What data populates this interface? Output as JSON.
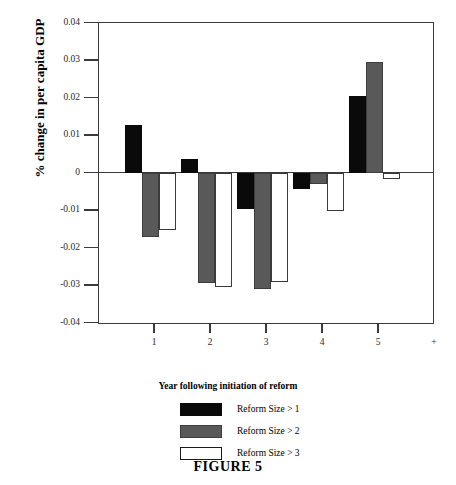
{
  "figure": {
    "caption": "FIGURE 5"
  },
  "chart_data": {
    "type": "bar",
    "title": "",
    "xlabel": "Year following initiation of reform",
    "ylabel": "% change in per capita GDP",
    "categories": [
      "1",
      "2",
      "3",
      "4",
      "5"
    ],
    "xtick_labels": [
      "1",
      "2",
      "3",
      "4",
      "5",
      "+"
    ],
    "ytick_labels": [
      "0.04",
      "0.03",
      "0.02",
      "0.01",
      "0",
      "-0.01",
      "-0.02",
      "-0.03",
      "-0.04"
    ],
    "ytick_values": [
      0.04,
      0.03,
      0.02,
      0.01,
      0,
      -0.01,
      -0.02,
      -0.03,
      -0.04
    ],
    "ylim": [
      -0.04,
      0.04
    ],
    "grid": false,
    "legend_position": "below",
    "series": [
      {
        "name": "Reform Size > 1",
        "color": "#0a0a0a",
        "fill": "black",
        "values": [
          0.0128,
          0.0035,
          -0.0097,
          -0.0045,
          0.0205
        ]
      },
      {
        "name": "Reform Size > 2",
        "color": "#595959",
        "fill": "gray",
        "values": [
          -0.0173,
          -0.0295,
          -0.031,
          -0.003,
          0.0296
        ]
      },
      {
        "name": "Reform Size > 3",
        "color": "#ffffff",
        "fill": "white",
        "values": [
          -0.0152,
          -0.0305,
          -0.0293,
          -0.0102,
          -0.0018
        ]
      }
    ]
  }
}
